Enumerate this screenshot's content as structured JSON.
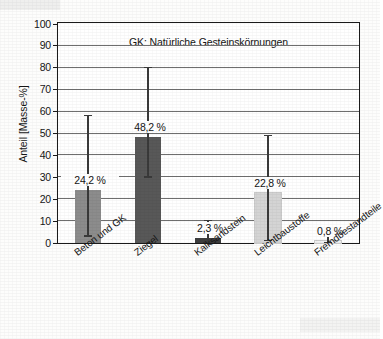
{
  "chart_data": {
    "type": "bar",
    "title": "GK: Natürliche Gesteinskörnungen",
    "xlabel": "",
    "ylabel": "Anteil [Masse-%]",
    "ylim": [
      0,
      100
    ],
    "ytick_step": 10,
    "yticks": [
      0,
      10,
      20,
      30,
      40,
      50,
      60,
      70,
      80,
      90,
      100
    ],
    "grid": true,
    "legend": "none",
    "categories": [
      "Beton und GK",
      "Ziegel",
      "Kalksandstein",
      "Leichtbaustoffe",
      "Fremdbestandteile"
    ],
    "values": [
      24.2,
      48.2,
      2.3,
      22.8,
      0.8
    ],
    "value_labels": [
      "24,2 %",
      "48,2 %",
      "2,3 %",
      "22,8 %",
      "0,8 %"
    ],
    "error_bars": [
      {
        "low": 3.0,
        "high": 58.0
      },
      {
        "low": 30.0,
        "high": 80.0
      },
      {
        "low": 0.0,
        "high": 10.0
      },
      {
        "low": 1.0,
        "high": 49.0
      },
      {
        "low": 0.0,
        "high": 6.0
      }
    ],
    "bar_colors": [
      "#8c8c8c",
      "#585858",
      "#3d3d3d",
      "#d4d4d4",
      "#f2f2f2"
    ],
    "axis_color": "#1a1a1a",
    "grid_color": "#6f6f6f",
    "error_color": "#3a3a3a"
  }
}
